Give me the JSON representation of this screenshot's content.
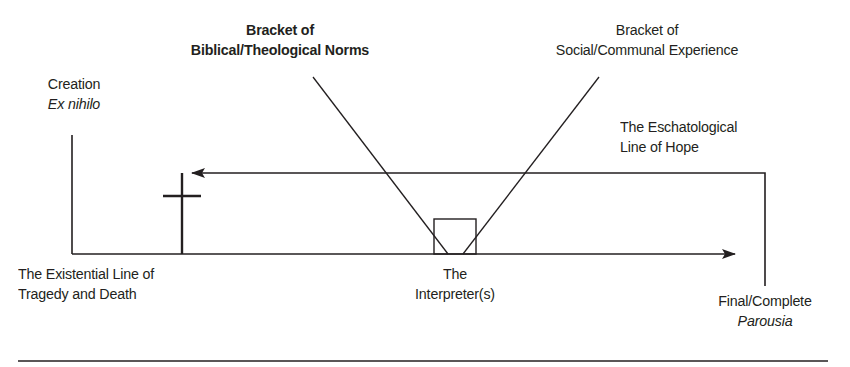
{
  "diagram": {
    "labels": {
      "creation": {
        "line1": "Creation",
        "line2": "Ex nihilo"
      },
      "biblical_bracket": {
        "line1": "Bracket of",
        "line2": "Biblical/Theological Norms"
      },
      "social_bracket": {
        "line1": "Bracket of",
        "line2": "Social/Communal Experience"
      },
      "eschatological": {
        "line1": "The Eschatological",
        "line2": "Line of Hope"
      },
      "existential": {
        "line1": "The Existential Line of",
        "line2": "Tragedy and Death"
      },
      "interpreter": {
        "line1": "The",
        "line2": "Interpreter(s)"
      },
      "parousia": {
        "line1": "Final/Complete",
        "line2": "Parousia"
      }
    },
    "elements": [
      {
        "id": "existential-line",
        "type": "arrow",
        "direction": "right",
        "from": "Creation",
        "to": "Final/Complete Parousia"
      },
      {
        "id": "eschatological-line",
        "type": "arrow",
        "direction": "left",
        "from": "Final/Complete Parousia",
        "to": "Cross"
      },
      {
        "id": "cross",
        "type": "symbol",
        "meaning": "Cross"
      },
      {
        "id": "interpreter-box",
        "type": "box",
        "meaning": "The Interpreter(s)"
      },
      {
        "id": "biblical-bracket-line",
        "type": "line",
        "meaning": "Bracket of Biblical/Theological Norms"
      },
      {
        "id": "social-bracket-line",
        "type": "line",
        "meaning": "Bracket of Social/Communal Experience"
      }
    ],
    "colors": {
      "ink": "#231f20",
      "background": "#ffffff"
    }
  }
}
